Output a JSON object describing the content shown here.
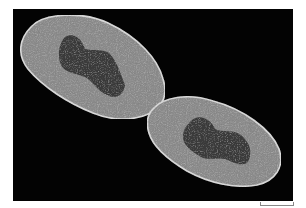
{
  "image": {
    "subject": "dividing rod-shaped bacterium (electron micrograph)",
    "background_color": "#030303",
    "cell_color": "#8a8a8a",
    "nucleoid_color": "#3a3a3a",
    "border_color": "#ffffff"
  },
  "scale_bar": {
    "label": ""
  }
}
